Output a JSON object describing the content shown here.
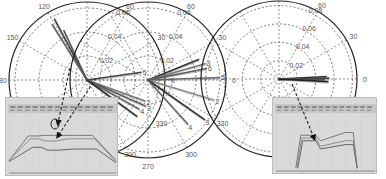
{
  "chart_data": [
    {
      "type": "polar",
      "title": "",
      "center": [
        87,
        80
      ],
      "radius_px": 78,
      "r_ticks": [
        0.02,
        0.04,
        0.06
      ],
      "r_tick_labels": [
        "0.02",
        "0.04",
        "0.06"
      ],
      "rmax": 0.065,
      "theta_ticks": [
        0,
        30,
        60,
        90,
        120,
        150,
        180,
        210,
        240,
        270,
        300,
        330
      ],
      "theta_labels_visible": [
        "90",
        "120",
        "150",
        "180",
        "60",
        "30",
        "0",
        "330",
        "300"
      ],
      "traces": [
        {
          "label": "",
          "angle_deg": 118,
          "r": 0.058,
          "color": "#444"
        },
        {
          "label": "",
          "angle_deg": 122,
          "r": 0.055,
          "color": "#666"
        },
        {
          "label": "",
          "angle_deg": 115,
          "r": 0.046,
          "color": "#555"
        },
        {
          "label": "5",
          "angle_deg": 8,
          "r": 0.046,
          "color": "#444"
        },
        {
          "label": "2",
          "angle_deg": 340,
          "r": 0.052,
          "color": "#777"
        },
        {
          "label": "3",
          "angle_deg": 336,
          "r": 0.054,
          "color": "#555"
        },
        {
          "label": "4",
          "angle_deg": 331,
          "r": 0.05,
          "color": "#666"
        },
        {
          "label": "",
          "angle_deg": 324,
          "r": 0.052,
          "color": "#333"
        }
      ]
    },
    {
      "type": "polar",
      "title": "",
      "center": [
        148,
        80
      ],
      "radius_px": 78,
      "r_ticks": [
        0.02,
        0.04,
        0.06
      ],
      "r_tick_labels": [
        "0.02",
        "0.04",
        "0.06"
      ],
      "rmax": 0.065,
      "theta_ticks": [
        0,
        30,
        60,
        90,
        120,
        150,
        180,
        210,
        240,
        270,
        300,
        330
      ],
      "theta_labels_visible": [
        "90",
        "60",
        "30",
        "0",
        "330",
        "300",
        "270"
      ],
      "traces": [
        {
          "label": "",
          "angle_deg": 22,
          "r": 0.046,
          "color": "#333"
        },
        {
          "label": "3",
          "angle_deg": 16,
          "r": 0.05,
          "color": "#777"
        },
        {
          "label": "6",
          "angle_deg": 11,
          "r": 0.05,
          "color": "#555"
        },
        {
          "label": "5",
          "angle_deg": 2,
          "r": 0.06,
          "color": "#666"
        },
        {
          "label": "2",
          "angle_deg": 343,
          "r": 0.058,
          "color": "#888"
        },
        {
          "label": "3",
          "angle_deg": 325,
          "r": 0.058,
          "color": "#333"
        },
        {
          "label": "4",
          "angle_deg": 312,
          "r": 0.05,
          "color": "#666"
        }
      ]
    },
    {
      "type": "polar",
      "title": "",
      "center": [
        279,
        79
      ],
      "radius_px": 78,
      "r_ticks": [
        0.02,
        0.04,
        0.06,
        0.08
      ],
      "r_tick_labels": [
        "0.02",
        "0.04",
        "0.06",
        "0.08"
      ],
      "rmax": 0.085,
      "theta_ticks": [
        0,
        30,
        60,
        90,
        120,
        150,
        180,
        210,
        240,
        270,
        300,
        330
      ],
      "theta_labels_visible": [
        "90",
        "60",
        "30",
        "0"
      ],
      "traces": [
        {
          "label": "",
          "angle_deg": 3,
          "r": 0.052,
          "color": "#333"
        },
        {
          "label": "",
          "angle_deg": 1,
          "r": 0.055,
          "color": "#444"
        },
        {
          "label": "",
          "angle_deg": -1,
          "r": 0.05,
          "color": "#555"
        },
        {
          "label": "",
          "angle_deg": -3,
          "r": 0.054,
          "color": "#222"
        }
      ]
    }
  ],
  "insets": [
    {
      "name": "left-inset",
      "type": "line",
      "x": 5,
      "y": 97,
      "w": 113,
      "h": 79,
      "series": [
        {
          "name": "upper",
          "points": [
            [
              0,
              78
            ],
            [
              18,
              35
            ],
            [
              28,
              35
            ],
            [
              32,
              34
            ],
            [
              48,
              34
            ],
            [
              60,
              34
            ],
            [
              78,
              34
            ],
            [
              100,
              78
            ]
          ]
        },
        {
          "name": "middle",
          "points": [
            [
              0,
              78
            ],
            [
              20,
              40
            ],
            [
              28,
              40
            ],
            [
              34,
              44
            ],
            [
              44,
              44
            ],
            [
              55,
              40
            ],
            [
              80,
              40
            ],
            [
              100,
              80
            ]
          ]
        },
        {
          "name": "lower",
          "points": [
            [
              0,
              80
            ],
            [
              22,
              55
            ],
            [
              30,
              55
            ],
            [
              36,
              60
            ],
            [
              46,
              60
            ],
            [
              60,
              58
            ],
            [
              82,
              58
            ],
            [
              100,
              82
            ]
          ]
        }
      ]
    },
    {
      "name": "right-inset",
      "type": "line",
      "x": 272,
      "y": 97,
      "w": 105,
      "h": 77,
      "series": [
        {
          "name": "upper",
          "points": [
            [
              20,
              95
            ],
            [
              25,
              35
            ],
            [
              40,
              35
            ],
            [
              45,
              45
            ],
            [
              70,
              30
            ],
            [
              78,
              30
            ],
            [
              82,
              95
            ]
          ]
        },
        {
          "name": "middle",
          "points": [
            [
              21,
              95
            ],
            [
              26,
              40
            ],
            [
              40,
              40
            ],
            [
              45,
              55
            ],
            [
              70,
              45
            ],
            [
              78,
              45
            ],
            [
              82,
              95
            ]
          ]
        },
        {
          "name": "lower",
          "points": [
            [
              22,
              95
            ],
            [
              27,
              45
            ],
            [
              40,
              45
            ],
            [
              45,
              60
            ],
            [
              70,
              52
            ],
            [
              78,
              52
            ],
            [
              82,
              95
            ]
          ]
        }
      ]
    }
  ]
}
